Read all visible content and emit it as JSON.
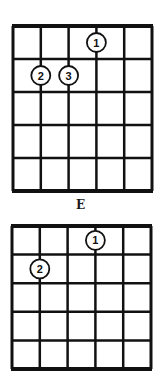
{
  "diagrams": [
    {
      "name": "E",
      "label": "E",
      "strings": 6,
      "frets": 5,
      "fingers": [
        {
          "number": "1",
          "string": 4,
          "fret": 1
        },
        {
          "number": "2",
          "string": 2,
          "fret": 2
        },
        {
          "number": "3",
          "string": 3,
          "fret": 2
        }
      ]
    },
    {
      "name": "second-chord",
      "label": "",
      "strings": 6,
      "frets": 5,
      "fingers": [
        {
          "number": "1",
          "string": 4,
          "fret": 1
        },
        {
          "number": "2",
          "string": 2,
          "fret": 2
        }
      ]
    }
  ],
  "colors": {
    "ink": "#111111",
    "background": "#ffffff"
  }
}
